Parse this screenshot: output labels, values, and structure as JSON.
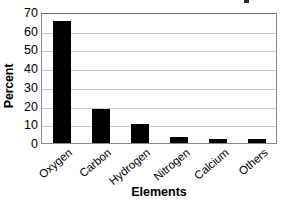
{
  "chart_data": {
    "type": "bar",
    "title": "",
    "xlabel": "Elements",
    "ylabel": "Percent",
    "categories": [
      "Oxygen",
      "Carbon",
      "Hydrogen",
      "Nitrogen",
      "Calcium",
      "Others"
    ],
    "values": [
      65,
      18,
      10,
      3,
      2,
      2
    ],
    "ylim": [
      0,
      70
    ],
    "ytick_values": [
      70,
      60,
      50,
      40,
      30,
      20,
      10,
      0
    ],
    "ytick_labels": [
      "70",
      "60",
      "50",
      "40",
      "30",
      "20",
      "10",
      "0"
    ],
    "grid": true,
    "grid_axis": "y",
    "legend": false,
    "legend_position": "none",
    "bar_color": "#000000",
    "grid_color": "#c9c9c9",
    "axis_color": "#8a8a8a",
    "background_color": "#ffffff",
    "xtick_rotation": -40
  }
}
